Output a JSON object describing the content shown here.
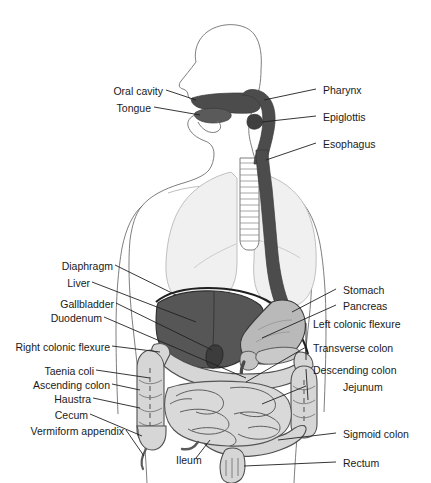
{
  "figure": {
    "background_color": "#ffffff",
    "line_color": "#231f20",
    "text_color": "#1a1a1a"
  },
  "palette": {
    "outline": "#4d4d4d",
    "body_outline": "#6b6b6b",
    "lung_fill": "#f2f2f2",
    "lung_outline": "#b3b3b3",
    "tract_dark": "#4a4a4a",
    "liver_fill": "#555555",
    "stomach_fill": "#b8b8b8",
    "intestine_fill": "#d4d4d4",
    "intestine_outline": "#5a5a5a",
    "pancreas_fill": "#c9c9c9",
    "leader_line": "#231f20"
  },
  "labels": {
    "left": [
      {
        "id": "oral-cavity",
        "text": "Oral cavity"
      },
      {
        "id": "tongue",
        "text": "Tongue"
      },
      {
        "id": "diaphragm",
        "text": "Diaphragm"
      },
      {
        "id": "liver",
        "text": "Liver"
      },
      {
        "id": "gallbladder",
        "text": "Gallbladder"
      },
      {
        "id": "duodenum",
        "text": "Duodenum"
      },
      {
        "id": "right-colonic-flexure",
        "text": "Right colonic flexure"
      },
      {
        "id": "taenia-coli",
        "text": "Taenia coli"
      },
      {
        "id": "ascending-colon",
        "text": "Ascending colon"
      },
      {
        "id": "haustra",
        "text": "Haustra"
      },
      {
        "id": "cecum",
        "text": "Cecum"
      },
      {
        "id": "vermiform-appendix",
        "text": "Vermiform appendix"
      }
    ],
    "right": [
      {
        "id": "pharynx",
        "text": "Pharynx"
      },
      {
        "id": "epiglottis",
        "text": "Epiglottis"
      },
      {
        "id": "esophagus",
        "text": "Esophagus"
      },
      {
        "id": "stomach",
        "text": "Stomach"
      },
      {
        "id": "pancreas",
        "text": "Pancreas"
      },
      {
        "id": "left-colonic-flexure",
        "text": "Left colonic flexure"
      },
      {
        "id": "transverse-colon",
        "text": "Transverse colon"
      },
      {
        "id": "descending-colon",
        "text": "Descending colon"
      },
      {
        "id": "jejunum",
        "text": "Jejunum"
      },
      {
        "id": "sigmoid-colon",
        "text": "Sigmoid colon"
      },
      {
        "id": "rectum",
        "text": "Rectum"
      }
    ],
    "bottom": [
      {
        "id": "ileum",
        "text": "Ileum"
      }
    ]
  }
}
